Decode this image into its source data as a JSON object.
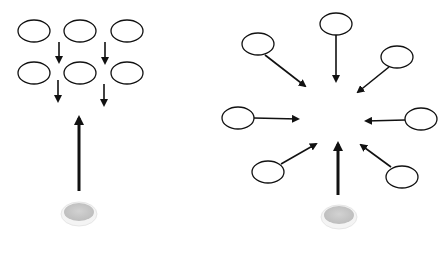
{
  "diagram": {
    "colors": {
      "background": "#ffffff",
      "stroke": "#111111",
      "source_fill": "#c8c8c8",
      "source_rim": "#f4f4f4"
    },
    "left_panel": {
      "label": "",
      "nodes": [
        {
          "id": "l-r1-c1",
          "cx": 34,
          "cy": 31
        },
        {
          "id": "l-r1-c2",
          "cx": 80,
          "cy": 31
        },
        {
          "id": "l-r1-c3",
          "cx": 127,
          "cy": 31
        },
        {
          "id": "l-r2-c1",
          "cx": 34,
          "cy": 73
        },
        {
          "id": "l-r2-c2",
          "cx": 80,
          "cy": 73
        },
        {
          "id": "l-r2-c3",
          "cx": 127,
          "cy": 73
        }
      ],
      "arrows": [
        {
          "x1": 59,
          "y1": 42,
          "x2": 59,
          "y2": 62
        },
        {
          "x1": 105,
          "y1": 42,
          "x2": 105,
          "y2": 63
        },
        {
          "x1": 58,
          "y1": 80,
          "x2": 58,
          "y2": 101
        },
        {
          "x1": 104,
          "y1": 84,
          "x2": 104,
          "y2": 105
        }
      ],
      "source_arrow": {
        "x1": 79,
        "y1": 191,
        "x2": 79,
        "y2": 118
      },
      "source": {
        "cx": 79,
        "cy": 212
      }
    },
    "right_panel": {
      "label": "",
      "nodes": [
        {
          "id": "r-top",
          "cx": 336,
          "cy": 24
        },
        {
          "id": "r-upper-left",
          "cx": 258,
          "cy": 44
        },
        {
          "id": "r-upper-right",
          "cx": 397,
          "cy": 57
        },
        {
          "id": "r-mid-left",
          "cx": 238,
          "cy": 118
        },
        {
          "id": "r-mid-right",
          "cx": 421,
          "cy": 119
        },
        {
          "id": "r-lower-left",
          "cx": 268,
          "cy": 172
        },
        {
          "id": "r-lower-right",
          "cx": 402,
          "cy": 177
        }
      ],
      "arrows": [
        {
          "x1": 336,
          "y1": 35,
          "x2": 336,
          "y2": 81
        },
        {
          "x1": 265,
          "y1": 55,
          "x2": 305,
          "y2": 86
        },
        {
          "x1": 389,
          "y1": 67,
          "x2": 358,
          "y2": 92
        },
        {
          "x1": 254,
          "y1": 118,
          "x2": 298,
          "y2": 119
        },
        {
          "x1": 405,
          "y1": 120,
          "x2": 366,
          "y2": 121
        },
        {
          "x1": 281,
          "y1": 164,
          "x2": 316,
          "y2": 144
        },
        {
          "x1": 391,
          "y1": 167,
          "x2": 361,
          "y2": 145
        }
      ],
      "source_arrow": {
        "x1": 338,
        "y1": 195,
        "x2": 338,
        "y2": 144
      },
      "source": {
        "cx": 339,
        "cy": 215
      }
    },
    "node_size": {
      "rx": 16,
      "ry": 11
    },
    "source_size": {
      "rx": 15,
      "ry": 9
    }
  }
}
